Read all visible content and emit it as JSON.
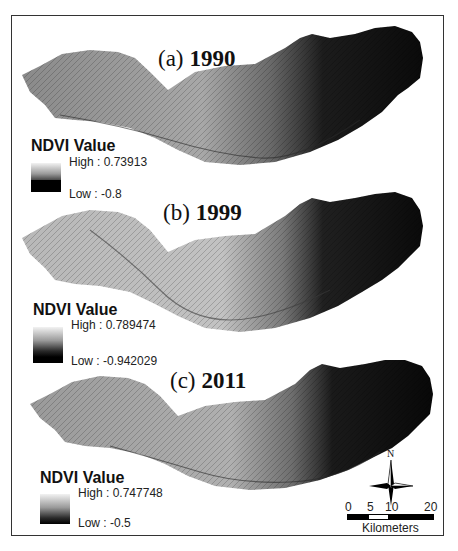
{
  "figure": {
    "panels": [
      {
        "label": "(a)",
        "year": "1990",
        "legend": {
          "title": "NDVI Value",
          "high": "High : 0.73913",
          "low": "Low : -0.8"
        }
      },
      {
        "label": "(b)",
        "year": "1999",
        "legend": {
          "title": "NDVI Value",
          "high": "High : 0.789474",
          "low": "Low : -0.942029"
        }
      },
      {
        "label": "(c)",
        "year": "2011",
        "legend": {
          "title": "NDVI Value",
          "high": "High : 0.747748",
          "low": "Low : -0.5"
        }
      }
    ],
    "north_arrow": {
      "label": "N"
    },
    "scale_bar": {
      "ticks": [
        "0",
        "5",
        "10",
        "20"
      ],
      "unit": "Kilometers"
    },
    "colors": {
      "high": "#f2f2f2",
      "low": "#000000",
      "frame": "#333333"
    }
  }
}
